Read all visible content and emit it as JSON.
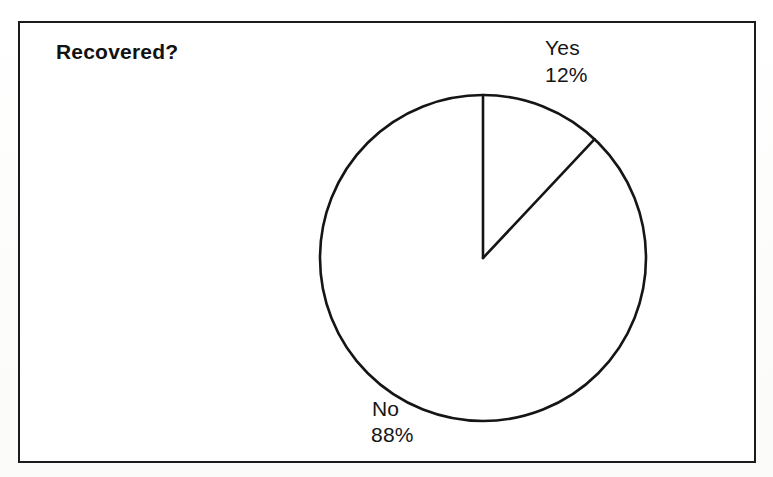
{
  "figure": {
    "title": "Recovered?",
    "frame_color": "#1b1b1b",
    "ink_color": "#151515",
    "background": "#ffffff"
  },
  "labels": {
    "yes_name": "Yes",
    "yes_value": "12%",
    "no_name": "No",
    "no_value": "88%"
  },
  "chart_data": {
    "type": "pie",
    "title": "Recovered?",
    "xlabel": "",
    "ylabel": "",
    "categories": [
      "Yes",
      "No"
    ],
    "values": [
      12,
      88
    ],
    "value_labels": [
      "12%",
      "88%"
    ],
    "units": "percent",
    "slices": [
      {
        "label": "Yes",
        "value": 12,
        "value_label": "12%",
        "start_angle_deg": 0,
        "end_angle_deg": 43.2,
        "fill": "#ffffff",
        "stroke": "#151515"
      },
      {
        "label": "No",
        "value": 88,
        "value_label": "88%",
        "start_angle_deg": 43.2,
        "end_angle_deg": 360,
        "fill": "#ffffff",
        "stroke": "#151515"
      }
    ],
    "start_angle": "12 o'clock",
    "direction": "clockwise",
    "legend": "none",
    "legend_position": "labels-outside",
    "grid": false,
    "total": 100,
    "geometry": {
      "center_x": 483,
      "center_y": 258,
      "radius": 163
    }
  }
}
